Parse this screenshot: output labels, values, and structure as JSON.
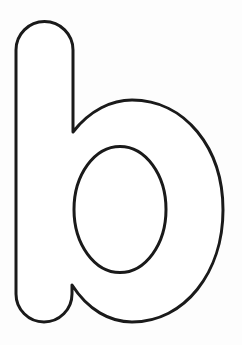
{
  "image": {
    "subject": "outlined lowercase letter",
    "letter": "b",
    "style": "coloring-page outline",
    "background_color": "#fdfdfd",
    "fill_color": "#ffffff",
    "stroke_color": "#1a1a1a"
  }
}
